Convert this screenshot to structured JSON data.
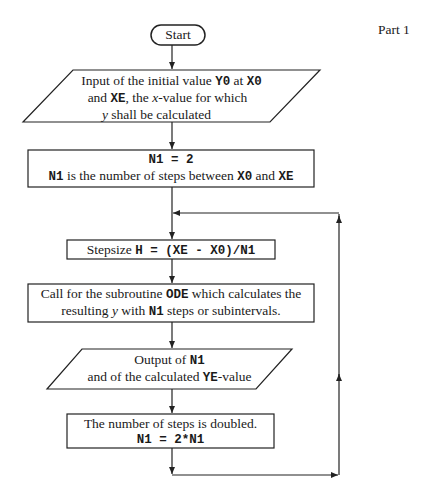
{
  "part_label": "Part 1",
  "nodes": {
    "start": {
      "label": "Start"
    },
    "input": {
      "line1_a": "Input of the initial value ",
      "line1_v1": "Y0",
      "line1_b": " at ",
      "line1_v2": "X0",
      "line2_a": "and ",
      "line2_v": "XE",
      "line2_b": ", the ",
      "line2_x": "x",
      "line2_c": "-value for which",
      "line3_y": "y",
      "line3_b": " shall be calculated"
    },
    "init": {
      "line1": "N1 = 2",
      "line2_v1": "N1",
      "line2_a": " is the number of steps between ",
      "line2_v2": "X0",
      "line2_b": " and ",
      "line2_v3": "XE"
    },
    "stepsize": {
      "label_a": "Stepsize ",
      "formula": "H = (XE - X0)/N1"
    },
    "call": {
      "line1_a": "Call for the subroutine ",
      "line1_v": "ODE",
      "line1_b": " which calculates the",
      "line2_a": "resulting ",
      "line2_y": "y",
      "line2_b": " with ",
      "line2_v": "N1",
      "line2_c": " steps or subintervals."
    },
    "output": {
      "line1_a": "Output of ",
      "line1_v": "N1",
      "line2_a": "and of the calculated ",
      "line2_v": "YE",
      "line2_b": "-value"
    },
    "double": {
      "line1": "The number of steps is doubled.",
      "line2": "N1 = 2*N1"
    }
  },
  "colors": {
    "stroke": "#222222",
    "text": "#1a1a1a",
    "background": "#ffffff"
  }
}
